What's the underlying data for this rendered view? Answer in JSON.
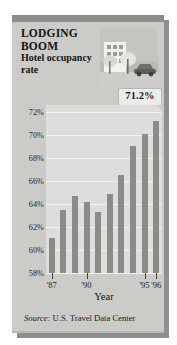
{
  "headline": "LODGING BOOM",
  "subhead": "Hotel occupancy rate",
  "callout_value": "71.2%",
  "axis_title": "Year",
  "source_prefix": "Source:",
  "source_text": " U.S. Travel Data Center",
  "photo": {
    "icon_name": "hotel-building-photo",
    "description": "hotel building with trees and a car"
  },
  "colors": {
    "panel": "#cbcbc8",
    "panel_top_band": "#8d8d8b",
    "plot_background": "#dedddb",
    "gridline": "#f4f4f3",
    "bar": "#8b8b88",
    "callout_background": "#ececeb",
    "shadow": "#8e8e8e",
    "text": "#141414"
  },
  "chart_data": {
    "type": "bar",
    "title": "LODGING BOOM",
    "subtitle": "Hotel occupancy rate",
    "xlabel": "Year",
    "ylabel": "",
    "ylim": [
      58,
      72.6
    ],
    "grid": true,
    "legend": "none",
    "ytick_labels": [
      "72%",
      "70%",
      "68%",
      "66%",
      "64%",
      "62%",
      "60%",
      "58%"
    ],
    "yticks": [
      72,
      70,
      68,
      66,
      64,
      62,
      60,
      58
    ],
    "xtick_labels": [
      "'87",
      "'90",
      "'95",
      "'96"
    ],
    "categories": [
      "'87",
      "'88",
      "'89",
      "'90",
      "'91",
      "'92",
      "'93",
      "'94",
      "'95",
      "'96"
    ],
    "values": [
      61.0,
      63.5,
      64.7,
      64.2,
      63.3,
      64.9,
      66.5,
      69.0,
      70.1,
      71.2
    ],
    "annotations": [
      {
        "label": "71.2%",
        "category": "'96",
        "value": 71.2
      }
    ]
  }
}
